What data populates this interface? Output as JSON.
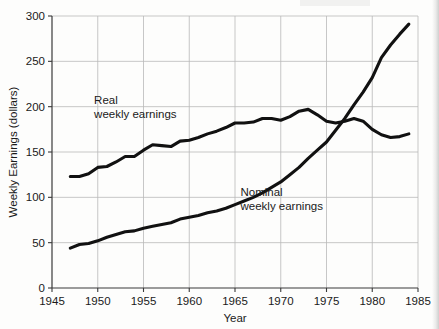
{
  "chart_data": {
    "type": "line",
    "title": "",
    "subtitle": "",
    "xlabel": "Year",
    "ylabel": "Weekly Earnings (dollars)",
    "xlim": [
      1945,
      1985
    ],
    "ylim": [
      0,
      300
    ],
    "xticks": [
      1945,
      1950,
      1955,
      1960,
      1965,
      1970,
      1975,
      1980,
      1985
    ],
    "xtick_labels": [
      "1945",
      "1950",
      "1955",
      "1960",
      "1965",
      "1970",
      "1975",
      "1980",
      "1985"
    ],
    "yticks": [
      0,
      50,
      100,
      150,
      200,
      250,
      300
    ],
    "ytick_labels": [
      "0",
      "50",
      "100",
      "150",
      "200",
      "250",
      "300"
    ],
    "grid": true,
    "legend_position": "inline-annotations",
    "line_color": "#111111",
    "grid_color": "#b9b9b9",
    "axis_color": "#3a3a3a",
    "background_color": "#fdfdfc",
    "annotations": [
      {
        "name": "real-weekly-earnings-label",
        "lines": [
          "Real",
          "weekly earnings"
        ],
        "x": 1949.6,
        "y": 203
      },
      {
        "name": "nominal-weekly-earnings-label",
        "lines": [
          "Nominal",
          "weekly earnings"
        ],
        "x": 1965.6,
        "y": 101
      }
    ],
    "series": [
      {
        "name": "Real weekly earnings",
        "label": "Real weekly earnings",
        "x": [
          1947,
          1948,
          1949,
          1950,
          1951,
          1952,
          1953,
          1954,
          1955,
          1956,
          1957,
          1958,
          1959,
          1960,
          1961,
          1962,
          1963,
          1964,
          1965,
          1966,
          1967,
          1968,
          1969,
          1970,
          1971,
          1972,
          1973,
          1974,
          1975,
          1976,
          1977,
          1978,
          1979,
          1980,
          1981,
          1982,
          1983,
          1984
        ],
        "values": [
          123,
          123,
          126,
          133,
          134,
          139,
          145,
          145,
          152,
          158,
          157,
          156,
          162,
          163,
          166,
          170,
          173,
          177,
          182,
          182,
          183,
          187,
          187,
          185,
          189,
          195,
          197,
          191,
          184,
          182,
          184,
          187,
          184,
          175,
          169,
          166,
          167,
          170
        ]
      },
      {
        "name": "Nominal weekly earnings",
        "label": "Nominal weekly earnings",
        "x": [
          1947,
          1948,
          1949,
          1950,
          1951,
          1952,
          1953,
          1954,
          1955,
          1956,
          1957,
          1958,
          1959,
          1960,
          1961,
          1962,
          1963,
          1964,
          1965,
          1966,
          1967,
          1968,
          1969,
          1970,
          1971,
          1972,
          1973,
          1974,
          1975,
          1976,
          1977,
          1978,
          1979,
          1980,
          1981,
          1982,
          1983,
          1984
        ],
        "values": [
          44,
          48,
          49,
          52,
          56,
          59,
          62,
          63,
          66,
          68,
          70,
          72,
          76,
          78,
          80,
          83,
          85,
          88,
          92,
          96,
          100,
          105,
          111,
          117,
          125,
          133,
          143,
          152,
          161,
          174,
          187,
          202,
          216,
          232,
          254,
          268,
          280,
          291
        ]
      }
    ]
  }
}
